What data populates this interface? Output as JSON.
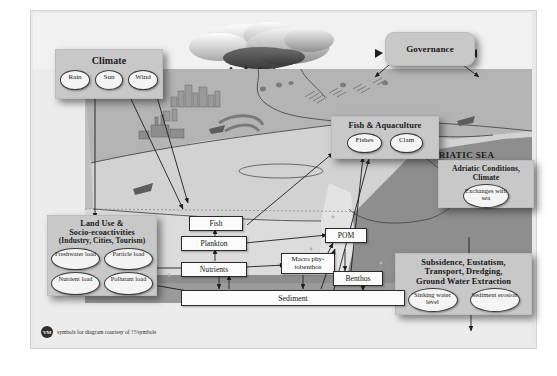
{
  "figure": {
    "sea_label": "ADRIATIC SEA",
    "credit": {
      "badge": "VM",
      "text": "symbols for diagram courtesy of ??/symbols"
    }
  },
  "panels": {
    "climate": {
      "title": "Climate",
      "items": [
        "Rain",
        "Sun",
        "Wind"
      ]
    },
    "governance": {
      "title": "Governance",
      "items": []
    },
    "fish_aquaculture": {
      "title": "Fish & Aquaculture",
      "items": [
        "Fishes",
        "Clam"
      ]
    },
    "adriatic_conditions": {
      "title": "Adriatic Conditions,\nClimate",
      "title_line1": "Adriatic Conditions,",
      "title_line2": "Climate",
      "items": [
        "Exchanges with sea"
      ]
    },
    "land_use": {
      "title_line1": "Land Use &",
      "title_line2": "Socio-ecoactivities",
      "title_line3": "(Industry, Cities, Tourism)",
      "items": [
        "Freshwater load",
        "Particle load",
        "Nutrient load",
        "Pollutant load"
      ]
    },
    "subsidence": {
      "title_line1": "Subsidence, Eustatism,",
      "title_line2": "Transport, Dredging,",
      "title_line3": "Ground Water Extraction",
      "items": [
        "Sinking water level",
        "Sediment erosion"
      ]
    }
  },
  "process_boxes": [
    {
      "id": "fish",
      "label": "Fish"
    },
    {
      "id": "plankton",
      "label": "Plankton"
    },
    {
      "id": "macro_phytobenthos",
      "label": "Macro phy-tobenthos"
    },
    {
      "id": "pom",
      "label": "POM"
    },
    {
      "id": "nutrients",
      "label": "Nutrients"
    },
    {
      "id": "benthos",
      "label": "Benthos"
    },
    {
      "id": "sediment",
      "label": "Sediment"
    }
  ],
  "colors": {
    "canvas": "#ececec",
    "panel": "#c8c8c8",
    "box": "#fbfbfb",
    "land_top": "#b8b8b8",
    "land_side": "#9a9a9a",
    "sea_deep": "#8e8e8e",
    "sea_shallow": "#d9d9d9",
    "stroke": "#2b2b2b"
  }
}
